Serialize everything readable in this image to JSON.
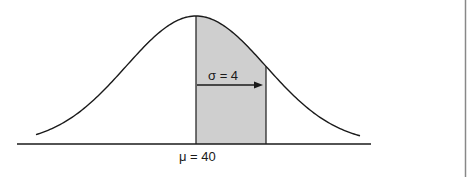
{
  "diagram": {
    "title": "",
    "type": "normal-distribution",
    "mean_label": "μ = 40",
    "sigma_label": "σ = 4",
    "mean": 40,
    "sd": 4,
    "shaded_region": {
      "from": "μ",
      "to": "μ + σ"
    },
    "colors": {
      "curve": "#1a1a1a",
      "shade": "#cfcfcf",
      "axis": "#1a1a1a",
      "border": "#888888"
    }
  }
}
